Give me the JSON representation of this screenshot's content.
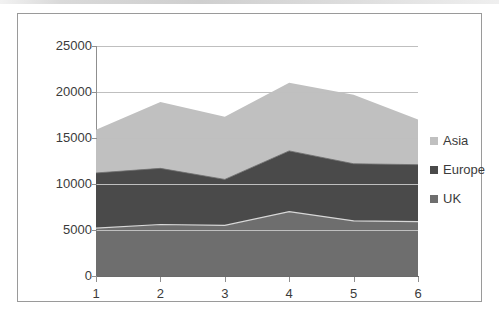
{
  "chart_data": {
    "type": "area",
    "stacked": true,
    "title": "",
    "xlabel": "",
    "ylabel": "",
    "categories": [
      "1",
      "2",
      "3",
      "4",
      "5",
      "6"
    ],
    "ylim": [
      0,
      25000
    ],
    "yticks": [
      0,
      5000,
      10000,
      15000,
      20000,
      25000
    ],
    "ytick_labels": [
      "0",
      "5000",
      "10000",
      "15000",
      "20000",
      "25000"
    ],
    "grid": true,
    "legend_position": "right",
    "series": [
      {
        "name": "UK",
        "color": "#6e6e6e",
        "values": [
          5200,
          5600,
          5500,
          7000,
          6000,
          5900
        ]
      },
      {
        "name": "Europe",
        "color": "#4a4a4a",
        "values": [
          6000,
          6100,
          5000,
          6600,
          6200,
          6200
        ]
      },
      {
        "name": "Asia",
        "color": "#c0c0c0",
        "values": [
          4700,
          7200,
          6800,
          7400,
          7500,
          4900
        ]
      }
    ],
    "cumulative_tops": {
      "uk": [
        5200,
        5600,
        5500,
        7000,
        6000,
        5900
      ],
      "uk_europe": [
        11200,
        11700,
        10500,
        13600,
        12200,
        12100
      ],
      "total": [
        15900,
        18900,
        17300,
        21000,
        19700,
        17000
      ]
    }
  },
  "legend": {
    "items": [
      {
        "label": "Asia",
        "color": "#c0c0c0"
      },
      {
        "label": "Europe",
        "color": "#4a4a4a"
      },
      {
        "label": "UK",
        "color": "#6e6e6e"
      }
    ]
  }
}
